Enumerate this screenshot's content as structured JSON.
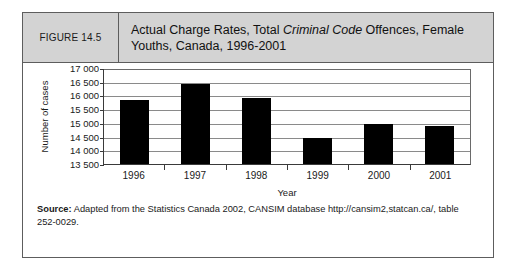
{
  "figure": {
    "number_label": "FIGURE 14.5",
    "title_part1": "Actual Charge Rates, Total ",
    "title_italic": "Criminal Code",
    "title_part2": " Offences, Female Youths, Canada, 1996-2001"
  },
  "source": {
    "label": "Source:",
    "text": " Adapted from the Statistics Canada 2002, CANSIM database http://cansim2,statcan.ca/, table 252-0029."
  },
  "chart_data": {
    "type": "bar",
    "title": "Actual Charge Rates, Total Criminal Code Offences, Female Youths, Canada, 1996-2001",
    "xlabel": "Year",
    "ylabel": "Number of cases",
    "categories": [
      "1996",
      "1997",
      "1998",
      "1999",
      "2000",
      "2001"
    ],
    "values": [
      15850,
      16400,
      15900,
      14450,
      14950,
      14900
    ],
    "ylim": [
      13500,
      17000
    ],
    "ytick_step": 500,
    "ytick_labels": [
      "17 000",
      "16 500",
      "16 000",
      "15 500",
      "15 000",
      "14 500",
      "14 000",
      "13 500"
    ],
    "ytick_values": [
      17000,
      16500,
      16000,
      15500,
      15000,
      14500,
      14000,
      13500
    ],
    "grid": true,
    "legend": "none",
    "bar_color": "#000000"
  }
}
